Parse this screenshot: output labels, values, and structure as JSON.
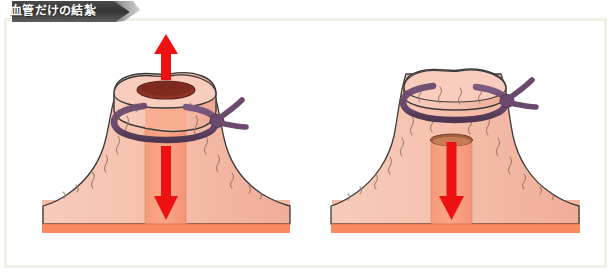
{
  "page": {
    "width": 615,
    "height": 276,
    "background": "#ffffff"
  },
  "banner": {
    "title": "血管だけの結紮",
    "fill_dark": "#3a3a3a",
    "fill_light": "#8d8d8d",
    "text_color": "#fdfdfd"
  },
  "frame": {
    "border_color": "#f2f0e2",
    "inner_background": "#ffffff"
  },
  "palette": {
    "tissue_light": "#f6c3b0",
    "tissue_mid": "#f3b49f",
    "tissue_base": "#fa8c63",
    "tissue_base_dark": "#f5794d",
    "lumen_channel": "#f9a183",
    "lumen_open_dark": "#8e3326",
    "lumen_rim": "#b0573c",
    "outline": "#3b3b3b",
    "texture_line": "#9b7a6b",
    "ligature": "#6b4a6e",
    "ligature_shadow": "#513853",
    "arrow_red": "#ee1111",
    "arrow_red_dark": "#d40808"
  },
  "panels": [
    {
      "id": "panel-left",
      "name": "vessel-stump-open",
      "caption": "",
      "ligature_state": "loose",
      "lumen_state": "open",
      "lumen_position": "top",
      "arrows": [
        {
          "direction": "up",
          "label": "outflow-up",
          "color": "#ee1111"
        },
        {
          "direction": "down",
          "label": "inflow-down",
          "color": "#ee1111"
        }
      ]
    },
    {
      "id": "panel-right",
      "name": "vessel-stump-ligated",
      "caption": "",
      "ligature_state": "tightened",
      "lumen_state": "closed",
      "lumen_position": "recessed",
      "arrows": [
        {
          "direction": "down",
          "label": "inflow-down",
          "color": "#ee1111"
        }
      ]
    }
  ]
}
